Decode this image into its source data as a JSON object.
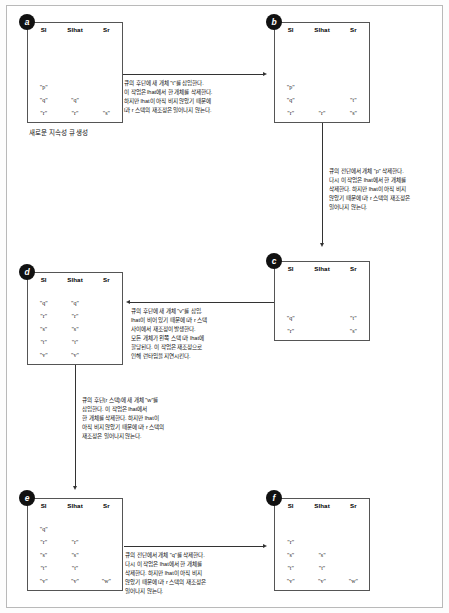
{
  "figure": {
    "columns": [
      "Sl",
      "Slhat",
      "Sr"
    ],
    "caption_a": "새로운 지속성 큐 생성"
  },
  "panels": [
    {
      "id": "a",
      "label": "a",
      "columns": [
        "Sl",
        "Slhat",
        "Sr"
      ],
      "rows": [
        [
          "\"p\"",
          "",
          ""
        ],
        [
          "\"q\"",
          "\"q\"",
          ""
        ],
        [
          "\"r\"",
          "\"r\"",
          "\"s\""
        ]
      ]
    },
    {
      "id": "b",
      "label": "b",
      "columns": [
        "Sl",
        "Slhat",
        "Sr"
      ],
      "rows": [
        [
          "\"p\"",
          "",
          ""
        ],
        [
          "\"q\"",
          "",
          "\"t\""
        ],
        [
          "\"r\"",
          "\"r\"",
          "\"s\""
        ]
      ]
    },
    {
      "id": "c",
      "label": "c",
      "columns": [
        "Sl",
        "Slhat",
        "Sr"
      ],
      "rows": [
        [
          "\"q\"",
          "",
          "\"t\""
        ],
        [
          "\"r\"",
          "",
          "\"s\""
        ]
      ]
    },
    {
      "id": "d",
      "label": "d",
      "columns": [
        "Sl",
        "Slhat",
        "Sr"
      ],
      "rows": [
        [
          "\"q\"",
          "\"q\"",
          ""
        ],
        [
          "\"r\"",
          "\"r\"",
          ""
        ],
        [
          "\"s\"",
          "\"s\"",
          ""
        ],
        [
          "\"t\"",
          "\"t\"",
          ""
        ],
        [
          "\"v\"",
          "\"v\"",
          ""
        ]
      ]
    },
    {
      "id": "e",
      "label": "e",
      "columns": [
        "Sl",
        "Slhat",
        "Sr"
      ],
      "rows": [
        [
          "\"q\"",
          "",
          ""
        ],
        [
          "\"r\"",
          "\"r\"",
          ""
        ],
        [
          "\"s\"",
          "\"s\"",
          ""
        ],
        [
          "\"t\"",
          "\"t\"",
          ""
        ],
        [
          "\"v\"",
          "\"v\"",
          "\"w\""
        ]
      ]
    },
    {
      "id": "f",
      "label": "f",
      "columns": [
        "Sl",
        "Slhat",
        "Sr"
      ],
      "rows": [
        [
          "\"r\"",
          "",
          ""
        ],
        [
          "\"s\"",
          "\"s\"",
          ""
        ],
        [
          "\"t\"",
          "\"t\"",
          ""
        ],
        [
          "\"v\"",
          "\"v\"",
          "\"w\""
        ]
      ]
    }
  ],
  "notes": {
    "a_to_b": [
      "큐의 후단에 새 개체 \"t\"를 삽입한다.",
      "이 작업은 lhat에서 한 개체를 삭제한다.",
      "하지만 lhat이 아직 비지 않았기 때문에",
      "l과 r 스택의 재조정은 일어나지 않는다."
    ],
    "b_to_c": [
      "큐의 전단에서 개체 \"p\" 삭제한다.",
      "다시 이 작업은 lhat에서 한 개체를",
      "삭제한다. 하지만 lhat이 아직 비지",
      "않았기 때문에 l과 r 스택의 재조정은",
      "일어나지 않는다."
    ],
    "c_to_d": [
      "큐의 후단에 새 개체 \"v\"를 삽입.",
      "lhat이 비어 있기 때문에 l과 r 스택",
      "사이에서 재조정이 발생한다.",
      "모든 개체가 왼쪽 스택 l과 lhat에",
      "할당된다. 이 작업은 재조정으로",
      "인해 런타임을 지연시킨다."
    ],
    "d_to_e": [
      "큐의 후단(r 스택)에 새 개체 \"w\"를",
      "삽입한다. 이 작업은 lhat에서",
      "한 개체를 삭제한다. 하지만 lhat이",
      "아직 비지 않았기 때문에 l과 r 스택의",
      "재조정은 일어나지 않는다."
    ],
    "e_to_f": [
      "큐의 전단에서 개체 \"q\"를 삭제한다.",
      "다시 이 작업은 lhat에서 한 개체를",
      "삭제한다. 하지만 lhat이 아직 비지",
      "않았기 때문에 l과 r 스택의 재조정은",
      "일어나지 않는다."
    ]
  }
}
